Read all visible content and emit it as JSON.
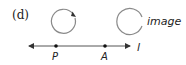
{
  "figure": {
    "panel_label": "(d)",
    "object_circle": {
      "orientation": "clockwise",
      "has_arrow": true
    },
    "image_circle": {
      "label": "image",
      "has_arrow": false
    },
    "line": {
      "label": "l",
      "double_arrow": true
    },
    "points": [
      {
        "label": "P"
      },
      {
        "label": "A"
      }
    ],
    "colors": {
      "circle_stroke": "#8a8a8a",
      "line_stroke": "#555555",
      "text": "#222222",
      "point_fill": "#111111"
    }
  }
}
